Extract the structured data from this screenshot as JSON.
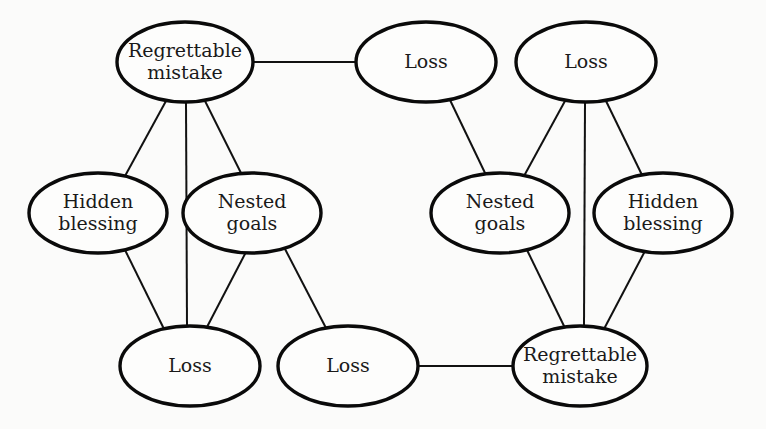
{
  "diagram": {
    "nodes": [
      {
        "id": "rm1",
        "lines": [
          "Regrettable",
          "mistake"
        ],
        "cx": 185,
        "cy": 62,
        "rx": 68,
        "ry": 40
      },
      {
        "id": "loss1",
        "lines": [
          "Loss"
        ],
        "cx": 426,
        "cy": 62,
        "rx": 70,
        "ry": 40
      },
      {
        "id": "loss2",
        "lines": [
          "Loss"
        ],
        "cx": 586,
        "cy": 62,
        "rx": 70,
        "ry": 40
      },
      {
        "id": "hb1",
        "lines": [
          "Hidden",
          "blessing"
        ],
        "cx": 98,
        "cy": 213,
        "rx": 69,
        "ry": 40
      },
      {
        "id": "ng1",
        "lines": [
          "Nested",
          "goals"
        ],
        "cx": 252,
        "cy": 213,
        "rx": 69,
        "ry": 40
      },
      {
        "id": "ng2",
        "lines": [
          "Nested",
          "goals"
        ],
        "cx": 500,
        "cy": 213,
        "rx": 69,
        "ry": 40
      },
      {
        "id": "hb2",
        "lines": [
          "Hidden",
          "blessing"
        ],
        "cx": 663,
        "cy": 213,
        "rx": 69,
        "ry": 40
      },
      {
        "id": "loss3",
        "lines": [
          "Loss"
        ],
        "cx": 190,
        "cy": 366,
        "rx": 70,
        "ry": 40
      },
      {
        "id": "loss4",
        "lines": [
          "Loss"
        ],
        "cx": 348,
        "cy": 366,
        "rx": 70,
        "ry": 40
      },
      {
        "id": "rm2",
        "lines": [
          "Regrettable",
          "mistake"
        ],
        "cx": 580,
        "cy": 366,
        "rx": 67,
        "ry": 40
      }
    ],
    "edges": [
      {
        "from": "rm1",
        "to": "loss1",
        "x1": 253,
        "y1": 62,
        "x2": 356,
        "y2": 62
      },
      {
        "from": "rm1",
        "to": "hb1",
        "x1": 166,
        "y1": 101,
        "x2": 125,
        "y2": 176
      },
      {
        "from": "rm1",
        "to": "loss3",
        "x1": 186,
        "y1": 102,
        "x2": 187,
        "y2": 326
      },
      {
        "from": "rm1",
        "to": "ng1",
        "x1": 205,
        "y1": 101,
        "x2": 242,
        "y2": 175
      },
      {
        "from": "hb1",
        "to": "loss3",
        "x1": 125,
        "y1": 250,
        "x2": 164,
        "y2": 329
      },
      {
        "from": "ng1",
        "to": "loss3",
        "x1": 246,
        "y1": 252,
        "x2": 207,
        "y2": 327
      },
      {
        "from": "ng1",
        "to": "loss4",
        "x1": 285,
        "y1": 249,
        "x2": 326,
        "y2": 328
      },
      {
        "from": "loss4",
        "to": "rm2",
        "x1": 418,
        "y1": 366,
        "x2": 513,
        "y2": 366
      },
      {
        "from": "loss1",
        "to": "ng2",
        "x1": 450,
        "y1": 100,
        "x2": 486,
        "y2": 175
      },
      {
        "from": "loss2",
        "to": "ng2",
        "x1": 565,
        "y1": 101,
        "x2": 524,
        "y2": 176
      },
      {
        "from": "loss2",
        "to": "rm2",
        "x1": 585,
        "y1": 102,
        "x2": 584,
        "y2": 326
      },
      {
        "from": "loss2",
        "to": "hb2",
        "x1": 606,
        "y1": 101,
        "x2": 642,
        "y2": 175
      },
      {
        "from": "ng2",
        "to": "rm2",
        "x1": 527,
        "y1": 250,
        "x2": 565,
        "y2": 328
      },
      {
        "from": "hb2",
        "to": "rm2",
        "x1": 645,
        "y1": 251,
        "x2": 604,
        "y2": 329
      }
    ]
  }
}
